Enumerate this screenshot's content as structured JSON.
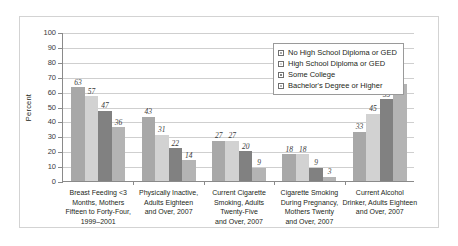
{
  "chart_data": {
    "type": "bar",
    "title": "",
    "xlabel": "",
    "ylabel": "Percent",
    "ylim": [
      0,
      100
    ],
    "ytick_step": 10,
    "ytick_labels": [
      "100",
      "90",
      "80",
      "70",
      "60",
      "50",
      "40",
      "30",
      "20",
      "10",
      "0"
    ],
    "grid": true,
    "legend_position": "top-right inside plot",
    "categories": [
      "Breast Feeding <3\nMonths, Mothers\nFifteen to Forty-Four,\n1999–2001",
      "Physically Inactive,\nAdults Eighteen\nand Over, 2007",
      "Current Cigarette\nSmoking, Adults\nTwenty-Five\nand Over, 2007",
      "Cigarette Smoking\nDuring Pregnancy,\nMothers Twenty\nand Over, 2007",
      "Current Alcohol\nDrinker, Adults Eighteen\nand Over, 2007"
    ],
    "series": [
      {
        "name": "No High School Diploma or GED",
        "color": "#a8a8a8",
        "values": [
          63,
          43,
          27,
          18,
          33
        ]
      },
      {
        "name": "High School Diploma or GED",
        "color": "#d2d2d2",
        "values": [
          57,
          31,
          27,
          18,
          45
        ]
      },
      {
        "name": "Some College",
        "color": "#818181",
        "values": [
          47,
          22,
          20,
          9,
          55
        ]
      },
      {
        "name": "Bachelor's Degree or Higher",
        "color": "#b4b4b4",
        "values": [
          36,
          14,
          9,
          3,
          65
        ]
      }
    ]
  }
}
